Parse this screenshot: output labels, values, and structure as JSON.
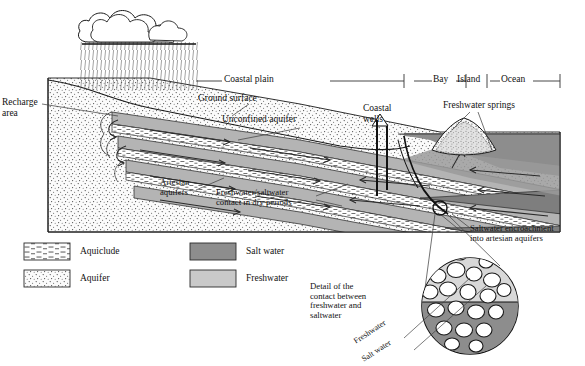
{
  "figure": {
    "title_partial": "",
    "domain_note": "Coastal aquifer cross-section"
  },
  "scale_bar": {
    "segments": [
      {
        "label": "Coastal plain"
      },
      {
        "label": "Bay"
      },
      {
        "label": "Island"
      },
      {
        "label": "Ocean"
      }
    ]
  },
  "labels": {
    "recharge_area": "Recharge\narea",
    "ground_surface": "Ground surface",
    "unconfined_aquifer": "Unconfined aquifer",
    "artesian_aquifers": "Artesian\naquifers",
    "contact_dry": "Freshwater/saltwater\ncontact in dry periods",
    "coastal_wells": "Coastal\nwells",
    "freshwater_springs": "Freshwater springs",
    "saltwater_encroachment": "Saltwater encroachment\ninto artesian aquifers",
    "detail_caption": "Detail of the\ncontact between\nfreshwater and\nsaltwater",
    "detail_freshwater": "Freshwater",
    "detail_saltwater": "Salt water"
  },
  "legend": {
    "items": [
      {
        "key": "aquiclude",
        "label": "Aquiclude",
        "pattern": "dashes"
      },
      {
        "key": "aquifer",
        "label": "Aquifer",
        "pattern": "stipple"
      },
      {
        "key": "salt_water",
        "label": "Salt water",
        "pattern": "solid",
        "color": "#8d8d8d"
      },
      {
        "key": "freshwater",
        "label": "Freshwater",
        "pattern": "solid",
        "color": "#c9c9c9"
      }
    ]
  },
  "colors": {
    "salt_water": "#8d8d8d",
    "freshwater": "#c9c9c9",
    "ocean": "#8d8d8d",
    "aquifer_band": "#b4b4b4",
    "bedrock": "#f2f2f2",
    "ink": "#1a1a1a"
  }
}
